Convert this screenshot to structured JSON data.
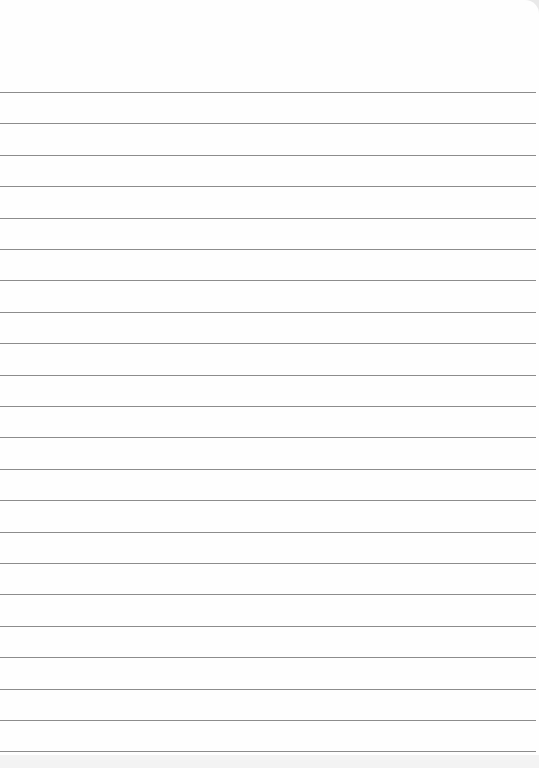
{
  "paper": {
    "type": "ruled notebook page",
    "background_color": "#fefefe",
    "line_color": "#8c8c8c",
    "line_count": 22,
    "first_line_y": 92,
    "line_spacing": 31.4,
    "line_width": 536,
    "text": ""
  }
}
